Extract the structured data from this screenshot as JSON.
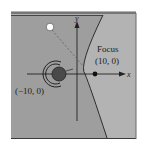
{
  "diagram": {
    "type": "hyperbolic-mirror-reflection",
    "axes": {
      "x_label": "x",
      "y_label": "y"
    },
    "focus": {
      "label": "Focus",
      "coords": "(10, 0)"
    },
    "object_point": {
      "coords": "(−10, 0)"
    },
    "colors": {
      "mirror_region": "#9e9e9e",
      "outside_region": "#b3b3b3",
      "frame": "#3a3a3a",
      "dashed_ray": "#6b6b6b",
      "focus_dot": "#111111",
      "object_disk": "#4a4a4a",
      "light_source": "#ffffff"
    }
  }
}
